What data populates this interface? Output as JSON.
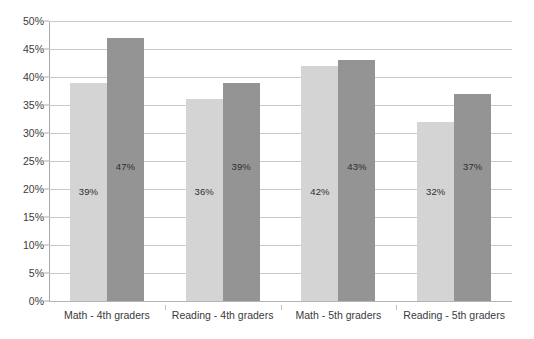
{
  "chart_data": {
    "type": "bar",
    "title": "",
    "subtitle": "",
    "xlabel": "",
    "ylabel": "",
    "categories": [
      "Math - 4th graders",
      "Reading - 4th graders",
      "Math - 5th graders",
      "Reading - 5th graders"
    ],
    "series": [
      {
        "name": "series-1",
        "color": "#d4d4d4",
        "values": [
          39,
          36,
          42,
          32
        ],
        "labels": [
          "39%",
          "36%",
          "42%",
          "32%"
        ]
      },
      {
        "name": "series-2",
        "color": "#949494",
        "values": [
          47,
          39,
          43,
          37
        ],
        "labels": [
          "47%",
          "39%",
          "43%",
          "37%"
        ]
      }
    ],
    "ylim": [
      0,
      50
    ],
    "ytick_values": [
      0,
      5,
      10,
      15,
      20,
      25,
      30,
      35,
      40,
      45,
      50
    ],
    "ytick_labels": [
      "0%",
      "5%",
      "10%",
      "15%",
      "20%",
      "25%",
      "30%",
      "35%",
      "40%",
      "45%",
      "50%"
    ],
    "grid": true,
    "legend": "none",
    "value_labels_inside_bars": true
  },
  "colors": {
    "series_light": "#d4d4d4",
    "series_dark": "#949494",
    "gridline": "#c9c9c9",
    "axis": "#a8a8a8",
    "text": "#3b3b3b",
    "background": "#ffffff"
  }
}
